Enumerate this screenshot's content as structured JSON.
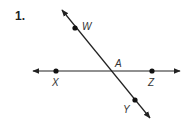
{
  "problem": {
    "number": "1."
  },
  "diagram": {
    "lines": [
      {
        "name": "line-WY",
        "from": [
          62,
          10
        ],
        "to": [
          150,
          118
        ]
      },
      {
        "name": "line-XZ",
        "from": [
          33,
          71
        ],
        "to": [
          180,
          71
        ]
      }
    ],
    "points": [
      {
        "id": "W",
        "label": "W",
        "x": 75,
        "y": 28,
        "lx": 82,
        "ly": 30
      },
      {
        "id": "X",
        "label": "X",
        "x": 56,
        "y": 71,
        "lx": 52,
        "ly": 86
      },
      {
        "id": "Z",
        "label": "Z",
        "x": 152,
        "y": 71,
        "lx": 148,
        "ly": 86
      },
      {
        "id": "Y",
        "label": "Y",
        "x": 135,
        "y": 100,
        "lx": 123,
        "ly": 113
      },
      {
        "id": "A",
        "label": "A",
        "x": 110,
        "y": 71,
        "lx": 115,
        "ly": 67,
        "dot": false
      }
    ],
    "color": "#222222"
  }
}
